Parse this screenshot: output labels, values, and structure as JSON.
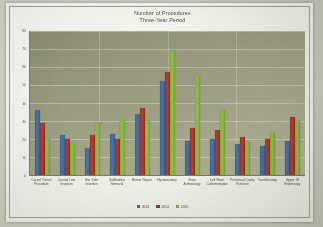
{
  "chart_data": {
    "type": "bar",
    "title": "Number of Procedures",
    "subtitle": "Three-Year Period",
    "xlabel": "",
    "ylabel": "",
    "ylim": [
      0,
      80
    ],
    "yticks": [
      0,
      10,
      20,
      30,
      40,
      50,
      60,
      70,
      80
    ],
    "grid": true,
    "legend_position": "bottom",
    "categories": [
      "Carpal Tunnel Procedure",
      "Central Line Insertion",
      "Ear Tube Insertion",
      "Gallbladder Removal",
      "Hernia Repair",
      "Hysterectomy",
      "Knee Arthroscopy",
      "Left Heart Catheterization",
      "Peritoneal Cavity Puncture",
      "Tonsillectomy",
      "Upper GI Endoscopy"
    ],
    "series": [
      {
        "name": "2013",
        "color": "#3d669e",
        "values": [
          36,
          22,
          15,
          23,
          34,
          52,
          19,
          20,
          17,
          16,
          19
        ]
      },
      {
        "name": "2014",
        "color": "#9c3422",
        "values": [
          29,
          20,
          22,
          20,
          37,
          57,
          26,
          25,
          21,
          20,
          32
        ]
      },
      {
        "name": "2015",
        "color": "#86b03c",
        "values": [
          20,
          17,
          29,
          31,
          30,
          69,
          55,
          36,
          19,
          24,
          30
        ]
      }
    ]
  }
}
